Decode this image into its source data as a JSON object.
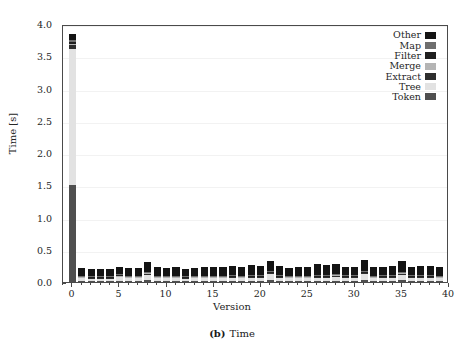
{
  "caption": {
    "tag": "(b)",
    "text": "Time"
  },
  "axes": {
    "ylabel": "Time [s]",
    "xlabel": "Version",
    "yticks": [
      "0.0",
      "0.5",
      "1.0",
      "1.5",
      "2.0",
      "2.5",
      "3.0",
      "3.5",
      "4.0"
    ],
    "xticks": [
      "0",
      "5",
      "10",
      "15",
      "20",
      "25",
      "30",
      "35",
      "40"
    ]
  },
  "legend": {
    "position": "top-right",
    "items": [
      {
        "label": "Other",
        "color": "#141414"
      },
      {
        "label": "Map",
        "color": "#6e6e6e"
      },
      {
        "label": "Filter",
        "color": "#1f1f1f"
      },
      {
        "label": "Merge",
        "color": "#b4b4b4"
      },
      {
        "label": "Extract",
        "color": "#2e2e2e"
      },
      {
        "label": "Tree",
        "color": "#e2e2e2"
      },
      {
        "label": "Token",
        "color": "#4f4f4f"
      }
    ]
  },
  "chart_data": {
    "type": "bar",
    "stacked": true,
    "xlabel": "Version",
    "ylabel": "Time [s]",
    "xlim": [
      -1,
      40
    ],
    "ylim": [
      0.0,
      4.0
    ],
    "grid": true,
    "categories": [
      0,
      1,
      2,
      3,
      4,
      5,
      6,
      7,
      8,
      9,
      10,
      11,
      12,
      13,
      14,
      15,
      16,
      17,
      18,
      19,
      20,
      21,
      22,
      23,
      24,
      25,
      26,
      27,
      28,
      29,
      30,
      31,
      32,
      33,
      34,
      35,
      36,
      37,
      38,
      39
    ],
    "series": [
      {
        "name": "Token",
        "color": "#4f4f4f",
        "values": [
          1.5,
          0.02,
          0.02,
          0.02,
          0.02,
          0.02,
          0.02,
          0.02,
          0.03,
          0.02,
          0.02,
          0.02,
          0.02,
          0.02,
          0.02,
          0.02,
          0.02,
          0.02,
          0.02,
          0.02,
          0.02,
          0.03,
          0.02,
          0.02,
          0.02,
          0.02,
          0.02,
          0.02,
          0.02,
          0.02,
          0.02,
          0.03,
          0.02,
          0.02,
          0.02,
          0.03,
          0.02,
          0.02,
          0.02,
          0.02
        ]
      },
      {
        "name": "Tree",
        "color": "#e2e2e2",
        "values": [
          2.12,
          0.04,
          0.03,
          0.03,
          0.03,
          0.06,
          0.04,
          0.04,
          0.09,
          0.04,
          0.04,
          0.04,
          0.03,
          0.04,
          0.04,
          0.04,
          0.04,
          0.05,
          0.04,
          0.05,
          0.05,
          0.1,
          0.05,
          0.04,
          0.04,
          0.04,
          0.05,
          0.05,
          0.07,
          0.05,
          0.05,
          0.1,
          0.04,
          0.05,
          0.05,
          0.09,
          0.05,
          0.05,
          0.05,
          0.04
        ]
      },
      {
        "name": "Extract",
        "color": "#2e2e2e",
        "values": [
          0.05,
          0.01,
          0.01,
          0.01,
          0.01,
          0.01,
          0.01,
          0.01,
          0.01,
          0.01,
          0.01,
          0.01,
          0.01,
          0.01,
          0.01,
          0.01,
          0.01,
          0.01,
          0.01,
          0.01,
          0.01,
          0.01,
          0.01,
          0.01,
          0.01,
          0.01,
          0.01,
          0.01,
          0.01,
          0.01,
          0.01,
          0.01,
          0.01,
          0.01,
          0.01,
          0.01,
          0.01,
          0.01,
          0.01,
          0.01
        ]
      },
      {
        "name": "Merge",
        "color": "#b4b4b4",
        "values": [
          0.02,
          0.01,
          0.01,
          0.01,
          0.01,
          0.01,
          0.01,
          0.01,
          0.01,
          0.01,
          0.01,
          0.01,
          0.01,
          0.01,
          0.01,
          0.01,
          0.01,
          0.01,
          0.01,
          0.01,
          0.01,
          0.01,
          0.01,
          0.01,
          0.01,
          0.01,
          0.01,
          0.01,
          0.01,
          0.01,
          0.01,
          0.01,
          0.01,
          0.01,
          0.01,
          0.01,
          0.01,
          0.01,
          0.01,
          0.01
        ]
      },
      {
        "name": "Filter",
        "color": "#1f1f1f",
        "values": [
          0.03,
          0.01,
          0.01,
          0.01,
          0.01,
          0.01,
          0.01,
          0.01,
          0.01,
          0.01,
          0.01,
          0.01,
          0.01,
          0.01,
          0.01,
          0.01,
          0.01,
          0.01,
          0.01,
          0.01,
          0.01,
          0.01,
          0.01,
          0.01,
          0.01,
          0.01,
          0.01,
          0.01,
          0.01,
          0.01,
          0.01,
          0.01,
          0.01,
          0.01,
          0.01,
          0.01,
          0.01,
          0.01,
          0.01,
          0.01
        ]
      },
      {
        "name": "Map",
        "color": "#6e6e6e",
        "values": [
          0.03,
          0.01,
          0.01,
          0.01,
          0.01,
          0.01,
          0.01,
          0.01,
          0.01,
          0.01,
          0.01,
          0.01,
          0.01,
          0.01,
          0.01,
          0.01,
          0.01,
          0.01,
          0.01,
          0.01,
          0.01,
          0.01,
          0.01,
          0.01,
          0.01,
          0.01,
          0.01,
          0.01,
          0.01,
          0.01,
          0.01,
          0.01,
          0.01,
          0.01,
          0.01,
          0.01,
          0.01,
          0.01,
          0.01,
          0.01
        ]
      },
      {
        "name": "Other",
        "color": "#141414",
        "values": [
          0.1,
          0.12,
          0.11,
          0.11,
          0.11,
          0.11,
          0.12,
          0.12,
          0.15,
          0.13,
          0.12,
          0.13,
          0.11,
          0.12,
          0.13,
          0.14,
          0.13,
          0.14,
          0.13,
          0.15,
          0.14,
          0.15,
          0.14,
          0.12,
          0.13,
          0.13,
          0.17,
          0.15,
          0.15,
          0.13,
          0.13,
          0.17,
          0.13,
          0.13,
          0.14,
          0.16,
          0.13,
          0.14,
          0.14,
          0.13
        ]
      }
    ],
    "totals": [
      3.85,
      0.22,
      0.2,
      0.2,
      0.2,
      0.23,
      0.22,
      0.22,
      0.31,
      0.23,
      0.22,
      0.23,
      0.2,
      0.22,
      0.23,
      0.24,
      0.23,
      0.25,
      0.23,
      0.26,
      0.25,
      0.32,
      0.25,
      0.22,
      0.23,
      0.23,
      0.28,
      0.26,
      0.28,
      0.24,
      0.24,
      0.34,
      0.23,
      0.24,
      0.25,
      0.32,
      0.24,
      0.25,
      0.25,
      0.23
    ]
  }
}
